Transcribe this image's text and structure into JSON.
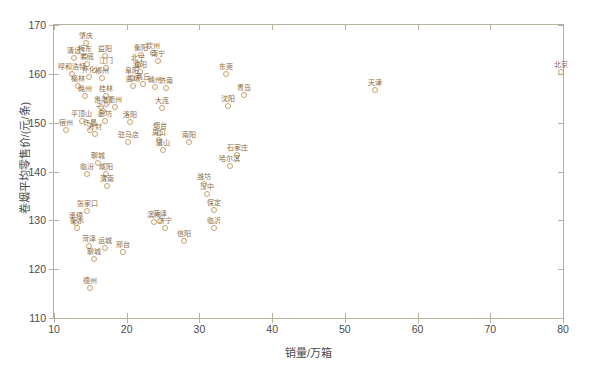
{
  "chart_data": {
    "type": "scatter",
    "title": "",
    "xlabel": "销量/万箱",
    "ylabel": "卷烟平均零售价/(元/条)",
    "xlim": [
      10,
      80
    ],
    "ylim": [
      110,
      170
    ],
    "xticks": [
      10,
      20,
      30,
      40,
      50,
      60,
      70,
      80
    ],
    "yticks": [
      110,
      120,
      130,
      140,
      150,
      160,
      170
    ],
    "grid": false,
    "legend": null,
    "marker": "open-circle",
    "marker_color": "#c9a06a",
    "label_color": "#8a6a43",
    "axes_color": "#b9b19f",
    "points": [
      {
        "label": "肇庆",
        "x": 14.4,
        "y": 166.3
      },
      {
        "label": "清远",
        "x": 12.8,
        "y": 163.2
      },
      {
        "label": "梅东",
        "x": 14.3,
        "y": 163.6
      },
      {
        "label": "益阳",
        "x": 17.0,
        "y": 163.6
      },
      {
        "label": "娄底",
        "x": 14.6,
        "y": 162.1
      },
      {
        "label": "江门",
        "x": 17.2,
        "y": 161.2
      },
      {
        "label": "呼和浩特",
        "x": 12.5,
        "y": 159.9
      },
      {
        "label": "怀化",
        "x": 14.8,
        "y": 159.3
      },
      {
        "label": "郴州",
        "x": 16.6,
        "y": 159.2
      },
      {
        "label": "榆林",
        "x": 13.3,
        "y": 157.5
      },
      {
        "label": "衡阳",
        "x": 21.9,
        "y": 163.8
      },
      {
        "label": "钦州",
        "x": 23.6,
        "y": 164.3
      },
      {
        "label": "南宁",
        "x": 24.3,
        "y": 162.7
      },
      {
        "label": "北宁",
        "x": 21.6,
        "y": 161.8
      },
      {
        "label": "濮阳",
        "x": 21.8,
        "y": 160.4
      },
      {
        "label": "阜阳",
        "x": 20.7,
        "y": 159.2
      },
      {
        "label": "曲靖",
        "x": 20.9,
        "y": 157.6
      },
      {
        "label": "商丘",
        "x": 22.3,
        "y": 158.0
      },
      {
        "label": "赣州",
        "x": 23.9,
        "y": 157.4
      },
      {
        "label": "济南",
        "x": 25.4,
        "y": 157.1
      },
      {
        "label": "东莞",
        "x": 33.7,
        "y": 160.0
      },
      {
        "label": "北京",
        "x": 79.7,
        "y": 160.3
      },
      {
        "label": "青岛",
        "x": 36.1,
        "y": 155.7
      },
      {
        "label": "天津",
        "x": 54.1,
        "y": 156.6
      },
      {
        "label": "沈阳",
        "x": 33.9,
        "y": 153.5
      },
      {
        "label": "赣州2",
        "x": 14.3,
        "y": 155.5
      },
      {
        "label": "桂林",
        "x": 17.2,
        "y": 155.4
      },
      {
        "label": "贵港",
        "x": 16.5,
        "y": 153.3
      },
      {
        "label": "衢州",
        "x": 18.4,
        "y": 153.2
      },
      {
        "label": "三沙",
        "x": 16.7,
        "y": 152.3
      },
      {
        "label": "大连",
        "x": 24.8,
        "y": 153.1
      },
      {
        "label": "平顶山",
        "x": 13.8,
        "y": 150.3
      },
      {
        "label": "廊坊",
        "x": 17.0,
        "y": 150.3
      },
      {
        "label": "洛阳",
        "x": 20.4,
        "y": 150.1
      },
      {
        "label": "宿州",
        "x": 11.7,
        "y": 148.5
      },
      {
        "label": "许昌",
        "x": 15.0,
        "y": 148.5
      },
      {
        "label": "开封",
        "x": 15.6,
        "y": 147.6
      },
      {
        "label": "烟台",
        "x": 24.6,
        "y": 147.8
      },
      {
        "label": "周口",
        "x": 24.4,
        "y": 146.4
      },
      {
        "label": "驻马店",
        "x": 20.2,
        "y": 146.0
      },
      {
        "label": "南阳",
        "x": 28.6,
        "y": 146.1
      },
      {
        "label": "唐山",
        "x": 25.0,
        "y": 144.4
      },
      {
        "label": "石家庄",
        "x": 35.2,
        "y": 143.4
      },
      {
        "label": "哈尔滨",
        "x": 34.2,
        "y": 141.2
      },
      {
        "label": "聊城",
        "x": 16.1,
        "y": 141.7
      },
      {
        "label": "临汾",
        "x": 14.5,
        "y": 139.5
      },
      {
        "label": "咸阳",
        "x": 17.1,
        "y": 139.5
      },
      {
        "label": "渭南",
        "x": 17.3,
        "y": 137.1
      },
      {
        "label": "潍坊",
        "x": 30.6,
        "y": 137.5
      },
      {
        "label": "汉中",
        "x": 31.1,
        "y": 135.3
      },
      {
        "label": "保定",
        "x": 32.0,
        "y": 132.1
      },
      {
        "label": "张家口",
        "x": 14.6,
        "y": 131.9
      },
      {
        "label": "承德",
        "x": 13.0,
        "y": 129.4
      },
      {
        "label": "衡水",
        "x": 13.1,
        "y": 128.4
      },
      {
        "label": "滨州",
        "x": 23.8,
        "y": 129.6
      },
      {
        "label": "菏泽",
        "x": 24.6,
        "y": 129.9
      },
      {
        "label": "济宁",
        "x": 25.2,
        "y": 128.5
      },
      {
        "label": "临沂",
        "x": 32.0,
        "y": 128.4
      },
      {
        "label": "信阳",
        "x": 27.9,
        "y": 125.8
      },
      {
        "label": "菏泽2",
        "x": 14.8,
        "y": 124.7
      },
      {
        "label": "运城",
        "x": 17.0,
        "y": 124.4
      },
      {
        "label": "邢台",
        "x": 19.5,
        "y": 123.5
      },
      {
        "label": "聊城2",
        "x": 15.5,
        "y": 122.0
      },
      {
        "label": "德州",
        "x": 15.0,
        "y": 116.2
      }
    ]
  }
}
